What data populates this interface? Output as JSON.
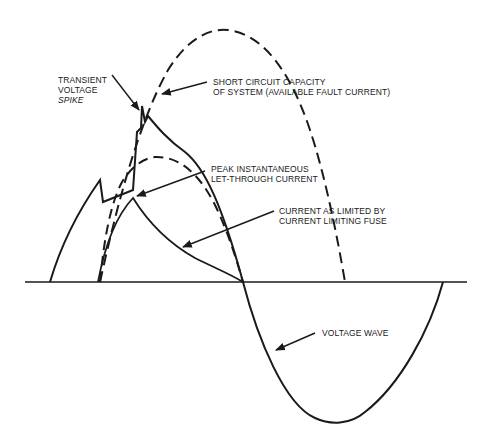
{
  "diagram": {
    "colors": {
      "ink": "#1a1a1a",
      "background": "#ffffff"
    },
    "labels": {
      "transient_spike": {
        "line1": "TRANSIENT",
        "line2": "VOLTAGE",
        "line3": "SPIKE"
      },
      "short_circuit": {
        "line1": "SHORT CIRCUIT CAPACITY",
        "line2": "OF SYSTEM (AVAILABLE FAULT CURRENT)"
      },
      "peak_letthrough": {
        "line1": "PEAK INSTANTANEOUS",
        "line2": "LET-THROUGH CURRENT"
      },
      "limited_current": {
        "line1": "CURRENT AS LIMITED BY",
        "line2": "CURRENT LIMITING FUSE"
      },
      "voltage_wave": {
        "line1": "VOLTAGE WAVE"
      }
    },
    "curves": [
      {
        "name": "available-fault-current",
        "style": "dashed"
      },
      {
        "name": "voltage-wave",
        "style": "solid"
      },
      {
        "name": "prospective-current-arc",
        "style": "dashed"
      },
      {
        "name": "limited-current",
        "style": "solid"
      },
      {
        "name": "zero-axis",
        "style": "solid"
      }
    ]
  }
}
